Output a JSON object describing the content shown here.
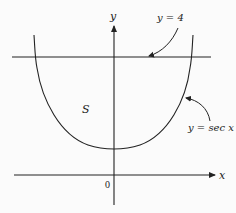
{
  "diagram": {
    "type": "function-graph",
    "axes": {
      "x_label": "x",
      "y_label": "y",
      "origin_label": "0"
    },
    "curves": [
      {
        "name": "secant",
        "label": "y = sec x",
        "color": "#222222"
      },
      {
        "name": "horizontal-line",
        "label": "y = 4",
        "color": "#222222"
      }
    ],
    "region_label": "S",
    "annotations": [
      {
        "text": "y = 4",
        "points_to": "horizontal line"
      },
      {
        "text": "y = sec x",
        "points_to": "secant curve"
      }
    ]
  }
}
